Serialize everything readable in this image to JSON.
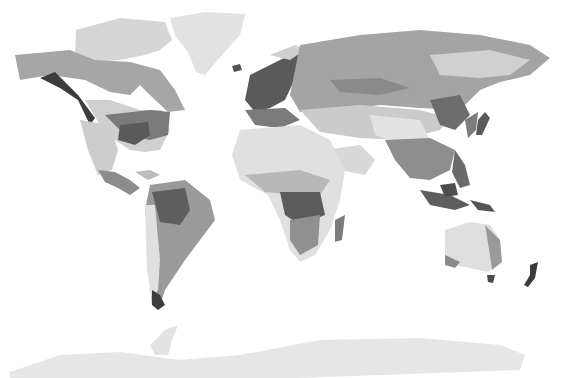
{
  "map": {
    "type": "world-climate-zones",
    "style": "grayscale",
    "background": "#ffffff",
    "zone_colors": {
      "ice": "#e6e6e6",
      "tundra": "#d4d4d4",
      "boreal": "#a8a8a8",
      "temperate": "#8a8a8a",
      "temperate_humid": "#6e6e6e",
      "oceanic": "#4a4a4a",
      "arid": "#e0e0e0",
      "semi_arid": "#c4c4c4",
      "savanna": "#9a9a9a",
      "tropical": "#767676",
      "rainforest": "#5c5c5c",
      "mountain": "#3a3a3a"
    }
  }
}
